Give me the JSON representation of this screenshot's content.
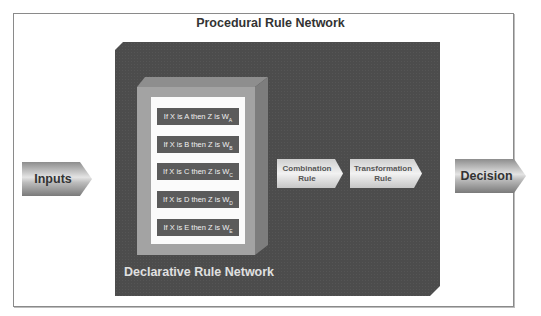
{
  "title": "Procedural Rule Network",
  "inputs_label": "Inputs",
  "decision_label": "Decision",
  "declarative": {
    "label": "Declarative Rule Network",
    "rules": [
      {
        "text": "If X is A then Z is W",
        "sub": "A"
      },
      {
        "text": "If X is B then Z is W",
        "sub": "B"
      },
      {
        "text": "If X is C then Z is W",
        "sub": "C"
      },
      {
        "text": "If X is D then Z is W",
        "sub": "D"
      },
      {
        "text": "If X is E then Z is W",
        "sub": "E"
      }
    ]
  },
  "combination_rule": "Combination Rule",
  "transformation_rule": "Transformation Rule",
  "colors": {
    "dark_box": "#4c4c4c",
    "inner_box": "#a3a3a3",
    "rule_bar": "#5b5b5b"
  }
}
